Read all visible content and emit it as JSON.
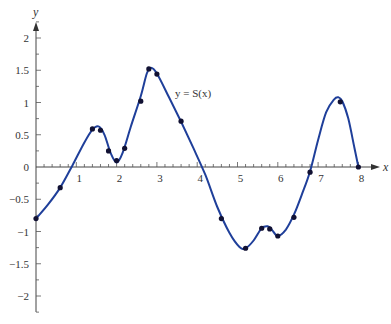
{
  "chart_data": {
    "type": "line",
    "title": "",
    "xlabel": "x",
    "ylabel": "y",
    "curve_label": "y = S(x)",
    "xlim": [
      0,
      8.3
    ],
    "ylim": [
      -2.3,
      2.3
    ],
    "grid": false,
    "legend": "none (inline label)",
    "x_ticks": [
      1,
      2,
      3,
      4,
      5,
      6,
      7,
      8
    ],
    "x_minor_step": 0.2,
    "y_ticks": [
      -2,
      -1.5,
      -1,
      -0.5,
      0,
      0.5,
      1,
      1.5,
      2
    ],
    "y_tick_labels": [
      "−2",
      "−1.5",
      "−1",
      "−0.5",
      "0",
      "0.5",
      "1",
      "1.5",
      "2"
    ],
    "y_minor_step": 0.25,
    "series": [
      {
        "name": "S(x) curve",
        "kind": "smooth_line",
        "color": "#1f3f9a",
        "x": [
          0,
          0.3,
          0.6,
          0.9,
          1.2,
          1.4,
          1.55,
          1.7,
          1.85,
          2.0,
          2.15,
          2.35,
          2.6,
          2.75,
          2.85,
          3.0,
          3.3,
          3.6,
          3.9,
          4.2,
          4.5,
          4.8,
          5.05,
          5.2,
          5.4,
          5.6,
          5.75,
          5.85,
          6.0,
          6.2,
          6.4,
          6.6,
          6.8,
          7.0,
          7.2,
          7.4,
          7.5,
          7.6,
          7.75,
          7.9,
          8.0
        ],
        "y": [
          -0.8,
          -0.58,
          -0.32,
          0.02,
          0.38,
          0.58,
          0.63,
          0.5,
          0.22,
          0.07,
          0.22,
          0.62,
          1.1,
          1.45,
          1.54,
          1.45,
          1.08,
          0.7,
          0.3,
          -0.12,
          -0.62,
          -1.02,
          -1.24,
          -1.26,
          -1.14,
          -0.95,
          -0.92,
          -0.97,
          -1.07,
          -0.97,
          -0.74,
          -0.42,
          -0.07,
          0.42,
          0.85,
          1.05,
          1.08,
          1.02,
          0.75,
          0.3,
          0.0
        ]
      },
      {
        "name": "data points",
        "kind": "scatter",
        "color": "#111133",
        "x": [
          0.0,
          0.6,
          1.4,
          1.6,
          1.8,
          2.0,
          2.2,
          2.6,
          2.8,
          3.0,
          3.6,
          4.6,
          5.2,
          5.6,
          5.8,
          6.0,
          6.4,
          6.8,
          7.55,
          8.0
        ],
        "y": [
          -0.8,
          -0.32,
          0.59,
          0.57,
          0.25,
          0.1,
          0.29,
          1.02,
          1.52,
          1.44,
          0.71,
          -0.8,
          -1.26,
          -0.95,
          -0.96,
          -1.07,
          -0.78,
          -0.08,
          1.01,
          0.0
        ]
      }
    ]
  },
  "layout": {
    "origin_px": [
      36,
      167
    ],
    "x_px_per_unit": 40.3,
    "y_px_per_unit": 64.5,
    "x_axis_end_px": 380,
    "y_axis_top_px": 22,
    "y_axis_bottom_px": 312,
    "label_pos_px": [
      175,
      97
    ]
  }
}
